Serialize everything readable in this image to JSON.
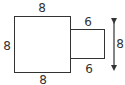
{
  "diagram": {
    "square": {
      "top_label": "8",
      "left_label": "8",
      "bottom_label": "8"
    },
    "rectangle": {
      "top_label": "6",
      "bottom_label": "6"
    },
    "height_arrow": {
      "label": "8"
    },
    "colors": {
      "stroke": "#333333",
      "background": "#ffffff"
    }
  }
}
